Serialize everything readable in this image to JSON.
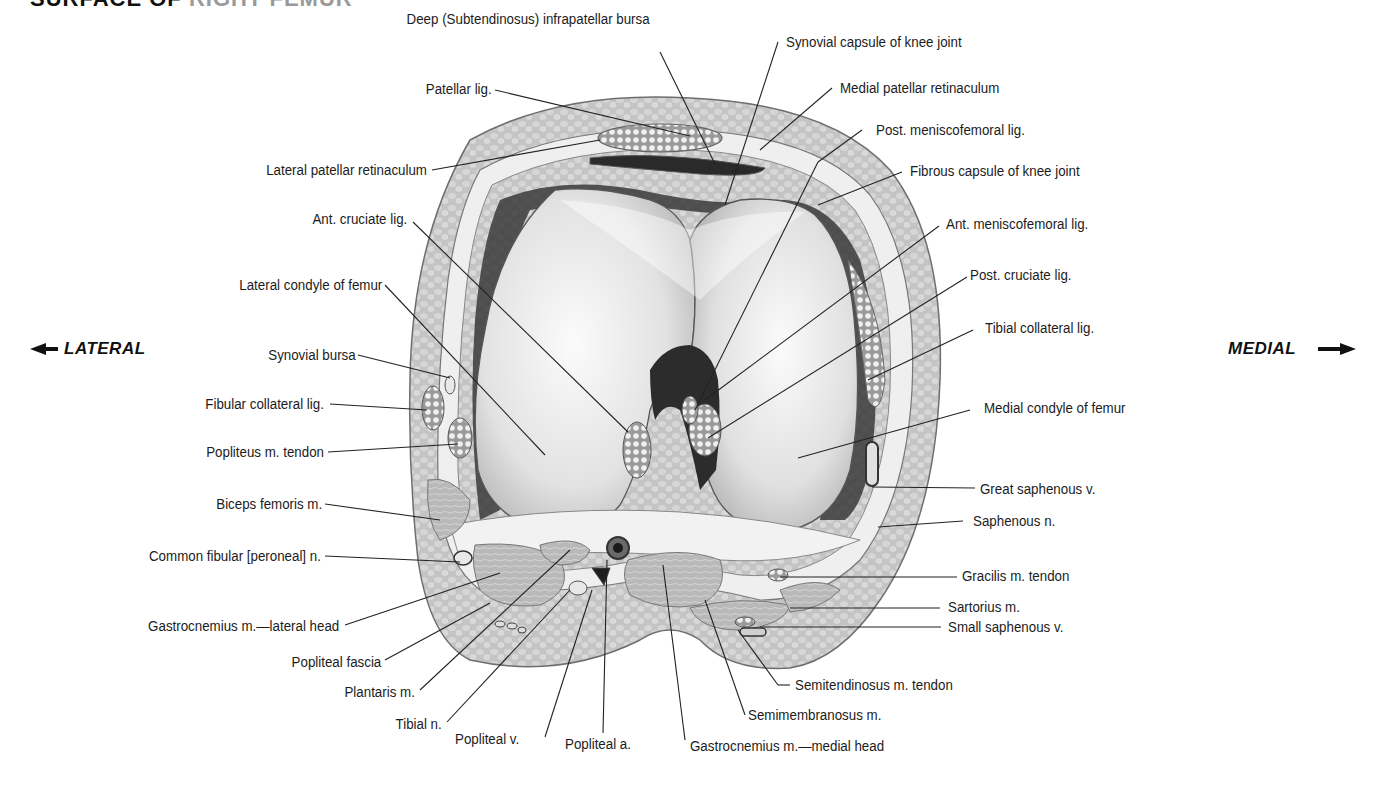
{
  "header": {
    "title_dark": "SURFACE OF",
    "title_light": "RIGHT FEMUR"
  },
  "orientation": {
    "lateral": "LATERAL",
    "medial": "MEDIAL"
  },
  "labels": {
    "deep_infrapatellar_bursa": "Deep (Subtendinosus) infrapatellar bursa",
    "patellar_lig": "Patellar lig.",
    "lateral_patellar_retinaculum": "Lateral patellar retinaculum",
    "ant_cruciate_lig": "Ant. cruciate lig.",
    "lateral_condyle": "Lateral condyle of femur",
    "synovial_bursa": "Synovial bursa",
    "fibular_collateral_lig": "Fibular collateral lig.",
    "popliteus_tendon": "Popliteus m. tendon",
    "biceps_femoris": "Biceps femoris m.",
    "common_fibular_n": "Common fibular [peroneal] n.",
    "gastrocnemius_lateral": "Gastrocnemius m.—lateral head",
    "popliteal_fascia": "Popliteal fascia",
    "plantaris": "Plantaris m.",
    "tibial_n": "Tibial n.",
    "popliteal_v": "Popliteal v.",
    "popliteal_a": "Popliteal a.",
    "gastrocnemius_medial": "Gastrocnemius m.—medial head",
    "semimembranosus": "Semimembranosus m.",
    "semitendinosus_tendon": "Semitendinosus m. tendon",
    "small_saphenous_v": "Small saphenous v.",
    "sartorius": "Sartorius m.",
    "gracilis_tendon": "Gracilis m. tendon",
    "saphenous_n": "Saphenous n.",
    "great_saphenous_v": "Great saphenous v.",
    "medial_condyle": "Medial condyle of femur",
    "tibial_collateral_lig": "Tibial collateral lig.",
    "post_cruciate_lig": "Post. cruciate lig.",
    "ant_meniscofemoral_lig": "Ant. meniscofemoral lig.",
    "fibrous_capsule": "Fibrous capsule of knee joint",
    "post_meniscofemoral_lig": "Post. meniscofemoral lig.",
    "medial_patellar_retinaculum": "Medial patellar retinaculum",
    "synovial_capsule": "Synovial capsule of knee joint"
  },
  "colors": {
    "skin_outline": "#6e6e6e",
    "subcutaneous_fat": "#c9c9c9",
    "capsule": "#ececec",
    "bone": "#d8d8d8",
    "bone_highlight": "#f7f7f7",
    "notch_dark": "#2e2e2e",
    "muscle": "#b5b5b5",
    "leader_line": "#222222"
  }
}
